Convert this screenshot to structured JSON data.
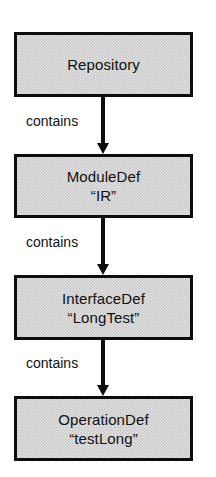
{
  "diagram": {
    "type": "flow-chain",
    "orientation": "vertical",
    "colors": {
      "node_fill": "#c9c9c9",
      "node_border": "#0d0d0d",
      "edge": "#0d0d0d",
      "text": "#101010",
      "background": "#ffffff"
    },
    "nodes": [
      {
        "id": "repository",
        "line1": "Repository",
        "line2": ""
      },
      {
        "id": "moduledef",
        "line1": "ModuleDef",
        "line2": "“IR”"
      },
      {
        "id": "interfacedef",
        "line1": "InterfaceDef",
        "line2": "“LongTest”"
      },
      {
        "id": "operationdef",
        "line1": "OperationDef",
        "line2": "“testLong”"
      }
    ],
    "edges": [
      {
        "id": "edge-1",
        "from": "repository",
        "to": "moduledef",
        "label": "contains"
      },
      {
        "id": "edge-2",
        "from": "moduledef",
        "to": "interfacedef",
        "label": "contains"
      },
      {
        "id": "edge-3",
        "from": "interfacedef",
        "to": "operationdef",
        "label": "contains"
      }
    ]
  }
}
